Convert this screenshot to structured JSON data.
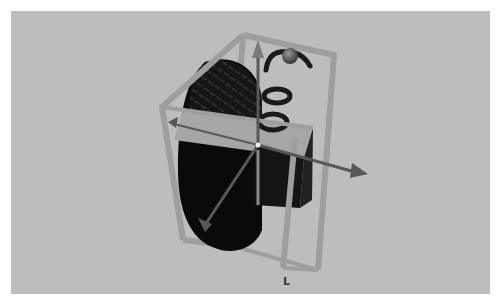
{
  "viewport": {
    "background": "#bdbdbd",
    "object": "tire-with-suspension",
    "manipulator": "move-gizmo",
    "axis_marker_label": "L"
  },
  "colors": {
    "bbox": "#9a9a9a",
    "arrow": "#555555",
    "tire": "#0d0d0d",
    "plate": "#a8a8a8"
  }
}
